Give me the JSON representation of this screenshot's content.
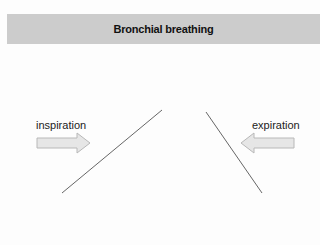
{
  "header": {
    "title": "Bronchial breathing"
  },
  "diagram": {
    "inspiration": {
      "label": "inspiration",
      "arrow_direction": "right",
      "line": {
        "x1": 162,
        "y1": 110,
        "x2": 62,
        "y2": 193
      }
    },
    "expiration": {
      "label": "expiration",
      "arrow_direction": "left",
      "line": {
        "x1": 206,
        "y1": 112,
        "x2": 262,
        "y2": 193
      }
    },
    "colors": {
      "header_bg": "#cccccc",
      "arrow_fill": "#e6e6e6",
      "arrow_stroke": "#b8b8b8",
      "line": "#555555"
    }
  }
}
